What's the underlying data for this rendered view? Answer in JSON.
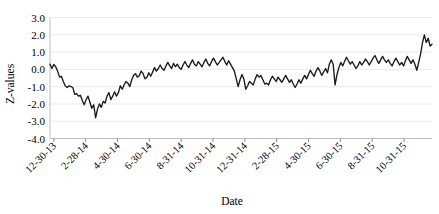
{
  "chart_data": {
    "type": "line",
    "title": "",
    "xlabel": "Date",
    "ylabel": "Z-values",
    "ylim": [
      -4.0,
      3.0
    ],
    "ytick_labels": [
      "3.0",
      "2.0",
      "1.0",
      "0.0",
      "-1.0",
      "-2.0",
      "-3.0",
      "-4.0"
    ],
    "ytick_values": [
      3.0,
      2.0,
      1.0,
      0.0,
      -1.0,
      -2.0,
      -3.0,
      -4.0
    ],
    "grid": true,
    "legend": "none",
    "xtick_labels": [
      "12-30-13",
      "2-28-14",
      "4-30-14",
      "6-30-14",
      "8-31-14",
      "10-31-14",
      "12-31-14",
      "2-28-15",
      "4-30-15",
      "6-30-15",
      "8-31-15",
      "10-31-15"
    ],
    "series": [
      {
        "name": "Z-values",
        "color": "#1a1a1a",
        "values": [
          0.3,
          0.05,
          0.28,
          0.15,
          -0.1,
          -0.45,
          -0.4,
          -0.7,
          -0.95,
          -1.05,
          -0.95,
          -1.0,
          -1.05,
          -1.45,
          -1.4,
          -1.55,
          -1.5,
          -1.8,
          -2.05,
          -1.75,
          -1.55,
          -1.9,
          -2.25,
          -2.05,
          -2.8,
          -2.3,
          -2.0,
          -2.2,
          -1.85,
          -1.95,
          -1.55,
          -1.35,
          -1.75,
          -1.55,
          -1.3,
          -1.55,
          -1.35,
          -0.95,
          -1.15,
          -0.9,
          -0.7,
          -0.8,
          -1.0,
          -0.6,
          -0.35,
          -0.25,
          -0.45,
          -0.35,
          -0.1,
          -0.25,
          -0.55,
          -0.45,
          -0.2,
          -0.4,
          -0.15,
          0.1,
          -0.1,
          0.05,
          0.25,
          0.05,
          -0.05,
          0.2,
          0.4,
          0.2,
          0.05,
          0.35,
          0.15,
          0.3,
          0.1,
          0.0,
          0.25,
          0.45,
          0.25,
          0.1,
          0.35,
          0.55,
          0.3,
          0.2,
          0.45,
          0.3,
          0.15,
          0.4,
          0.6,
          0.35,
          0.2,
          0.45,
          0.65,
          0.45,
          0.25,
          0.4,
          0.55,
          0.7,
          0.45,
          0.25,
          0.5,
          0.3,
          0.1,
          -0.1,
          -0.55,
          -1.0,
          -0.6,
          -0.3,
          -0.55,
          -1.15,
          -0.95,
          -0.7,
          -0.8,
          -0.9,
          -0.55,
          -0.3,
          -0.45,
          -0.35,
          -0.6,
          -0.85,
          -0.8,
          -0.9,
          -0.6,
          -0.4,
          -0.55,
          -0.7,
          -0.45,
          -0.6,
          -0.75,
          -0.55,
          -0.35,
          -0.55,
          -0.75,
          -0.6,
          -0.85,
          -1.05,
          -0.85,
          -0.6,
          -0.8,
          -0.55,
          -0.35,
          -0.55,
          -0.3,
          -0.05,
          -0.25,
          -0.4,
          -0.1,
          0.1,
          -0.1,
          -0.35,
          -0.15,
          0.05,
          -0.2,
          0.3,
          0.55,
          0.3,
          -0.9,
          -0.3,
          0.1,
          0.4,
          0.2,
          0.45,
          0.7,
          0.5,
          0.3,
          0.45,
          0.25,
          0.05,
          0.2,
          0.45,
          0.25,
          0.4,
          0.6,
          0.45,
          0.25,
          0.45,
          0.65,
          0.8,
          0.55,
          0.35,
          0.55,
          0.75,
          0.55,
          0.4,
          0.55,
          0.35,
          0.2,
          0.45,
          0.65,
          0.45,
          0.25,
          0.4,
          0.2,
          0.5,
          0.75,
          0.55,
          0.35,
          0.55,
          0.3,
          -0.05,
          0.4,
          0.9,
          1.55,
          2.0,
          1.55,
          1.8,
          1.35,
          1.45
        ]
      }
    ]
  }
}
